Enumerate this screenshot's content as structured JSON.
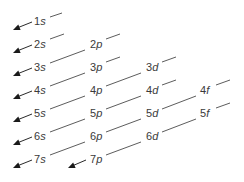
{
  "diagram": {
    "orbitals": [
      {
        "id": "1s",
        "n": "1",
        "l": "s",
        "x": 34,
        "y": 25,
        "line": [
          50,
          17,
          62,
          13
        ]
      },
      {
        "id": "2s",
        "n": "2",
        "l": "s",
        "x": 34,
        "y": 48,
        "line": [
          50,
          39,
          64,
          34
        ]
      },
      {
        "id": "2p",
        "n": "2",
        "l": "p",
        "x": 90,
        "y": 48,
        "line": [
          106,
          39,
          120,
          34
        ]
      },
      {
        "id": "3s",
        "n": "3",
        "l": "s",
        "x": 34,
        "y": 71,
        "line": [
          50,
          63,
          85,
          50
        ]
      },
      {
        "id": "3p",
        "n": "3",
        "l": "p",
        "x": 90,
        "y": 71,
        "line": [
          106,
          62,
          120,
          57
        ]
      },
      {
        "id": "3d",
        "n": "3",
        "l": "d",
        "x": 146,
        "y": 71,
        "line": [
          162,
          62,
          176,
          57
        ]
      },
      {
        "id": "4s",
        "n": "4",
        "l": "s",
        "x": 34,
        "y": 94,
        "line": [
          50,
          86,
          85,
          73
        ]
      },
      {
        "id": "4p",
        "n": "4",
        "l": "p",
        "x": 90,
        "y": 94,
        "line": [
          106,
          86,
          141,
          73
        ]
      },
      {
        "id": "4d",
        "n": "4",
        "l": "d",
        "x": 146,
        "y": 94,
        "line": [
          162,
          85,
          176,
          80
        ]
      },
      {
        "id": "4f",
        "n": "4",
        "l": "f",
        "x": 200,
        "y": 94,
        "line": [
          216,
          85,
          230,
          80
        ]
      },
      {
        "id": "5s",
        "n": "5",
        "l": "s",
        "x": 34,
        "y": 117,
        "line": [
          50,
          109,
          85,
          96
        ]
      },
      {
        "id": "5p",
        "n": "5",
        "l": "p",
        "x": 90,
        "y": 117,
        "line": [
          106,
          109,
          141,
          96
        ]
      },
      {
        "id": "5d",
        "n": "5",
        "l": "d",
        "x": 146,
        "y": 117,
        "line": [
          162,
          109,
          196,
          96
        ]
      },
      {
        "id": "5f",
        "n": "5",
        "l": "f",
        "x": 200,
        "y": 117,
        "line": [
          216,
          108,
          230,
          103
        ]
      },
      {
        "id": "6s",
        "n": "6",
        "l": "s",
        "x": 34,
        "y": 140,
        "line": [
          50,
          132,
          85,
          119
        ]
      },
      {
        "id": "6p",
        "n": "6",
        "l": "p",
        "x": 90,
        "y": 140,
        "line": [
          106,
          132,
          141,
          119
        ]
      },
      {
        "id": "6d",
        "n": "6",
        "l": "d",
        "x": 146,
        "y": 140,
        "line": [
          162,
          132,
          196,
          119
        ]
      },
      {
        "id": "7s",
        "n": "7",
        "l": "s",
        "x": 34,
        "y": 163,
        "line": [
          50,
          155,
          85,
          142
        ]
      },
      {
        "id": "7p",
        "n": "7",
        "l": "p",
        "x": 90,
        "y": 163,
        "line": [
          106,
          155,
          141,
          142
        ]
      }
    ],
    "arrows": [
      {
        "from": "1s",
        "x1": 32,
        "y1": 22,
        "x2": 13,
        "y2": 30
      },
      {
        "from": "2s",
        "x1": 32,
        "y1": 45,
        "x2": 13,
        "y2": 53
      },
      {
        "from": "3s",
        "x1": 32,
        "y1": 68,
        "x2": 13,
        "y2": 76
      },
      {
        "from": "4s",
        "x1": 32,
        "y1": 91,
        "x2": 13,
        "y2": 99
      },
      {
        "from": "5s",
        "x1": 32,
        "y1": 114,
        "x2": 13,
        "y2": 122
      },
      {
        "from": "6s",
        "x1": 32,
        "y1": 137,
        "x2": 13,
        "y2": 145
      },
      {
        "from": "7s",
        "x1": 32,
        "y1": 160,
        "x2": 13,
        "y2": 168
      },
      {
        "from": "7p",
        "x1": 86,
        "y1": 160,
        "x2": 68,
        "y2": 168
      }
    ]
  }
}
